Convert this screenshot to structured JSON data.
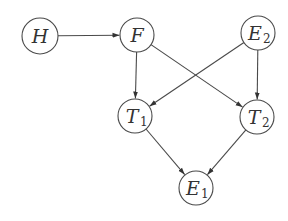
{
  "diagram": {
    "type": "directed-graph",
    "style": {
      "stroke": "#4a4a4a",
      "fill": "#ffffff",
      "text": "#333333"
    },
    "nodes": [
      {
        "id": "H",
        "label": "H",
        "sub": "",
        "x": 40,
        "y": 36,
        "r": 18
      },
      {
        "id": "F",
        "label": "F",
        "sub": "",
        "x": 137,
        "y": 35,
        "r": 17
      },
      {
        "id": "E2",
        "label": "E",
        "sub": "2",
        "x": 258,
        "y": 33,
        "r": 17
      },
      {
        "id": "T1",
        "label": "T",
        "sub": "1",
        "x": 135,
        "y": 116,
        "r": 17
      },
      {
        "id": "T2",
        "label": "T",
        "sub": "2",
        "x": 257,
        "y": 117,
        "r": 17
      },
      {
        "id": "E1",
        "label": "E",
        "sub": "1",
        "x": 196,
        "y": 188,
        "r": 17
      }
    ],
    "edges": [
      {
        "from": "H",
        "to": "F"
      },
      {
        "from": "F",
        "to": "T1"
      },
      {
        "from": "F",
        "to": "T2"
      },
      {
        "from": "E2",
        "to": "T1"
      },
      {
        "from": "E2",
        "to": "T2"
      },
      {
        "from": "T1",
        "to": "E1"
      },
      {
        "from": "T2",
        "to": "E1"
      }
    ]
  }
}
